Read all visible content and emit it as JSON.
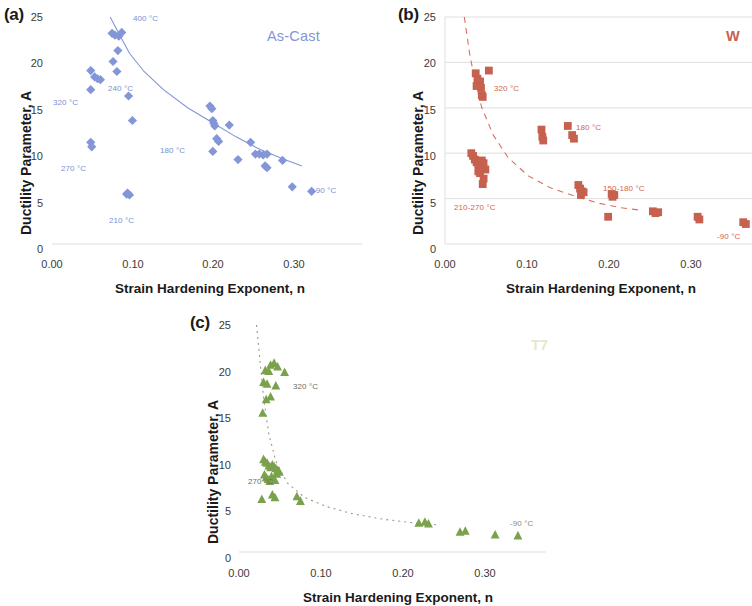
{
  "figure": {
    "axis_labels": {
      "x": "Strain Hardening Exponent, n",
      "y": "Ductility Parameter, A"
    },
    "xticks": [
      "0.00",
      "0.10",
      "0.20",
      "0.30"
    ],
    "xtick_values": [
      0.0,
      0.1,
      0.2,
      0.3
    ],
    "yticks": [
      "0",
      "5",
      "10",
      "15",
      "20",
      "25"
    ],
    "ytick_values": [
      0,
      5,
      10,
      15,
      20,
      25
    ]
  },
  "panels": [
    {
      "tag": "(a)",
      "title": "As-Cast",
      "color": "#8296d8",
      "marker": "diamond",
      "annotations": [
        {
          "text": "400 °C",
          "x": 0.105,
          "y": 24.2
        },
        {
          "text": "320 °C",
          "x": -0.004,
          "y": 15.3
        },
        {
          "text": "240 °C",
          "x": 0.073,
          "y": 17.3
        },
        {
          "text": "270 °C",
          "x": 0.012,
          "y": 8.6
        },
        {
          "text": "210 °C",
          "x": 0.058,
          "y": 3.1
        },
        {
          "text": "180 °C",
          "x": 0.137,
          "y": 10.3
        },
        {
          "text": "-90 °C",
          "x": 0.282,
          "y": 6.2
        }
      ]
    },
    {
      "tag": "(b)",
      "title": "W",
      "color": "#c5614e",
      "marker": "square",
      "annotations": [
        {
          "text": "320 °C",
          "x": 0.065,
          "y": 17.4
        },
        {
          "text": "180 °C",
          "x": 0.158,
          "y": 13.0
        },
        {
          "text": "150-180 °C",
          "x": 0.198,
          "y": 6.3
        },
        {
          "text": "210-270 °C",
          "x": 0.0,
          "y": 4.7
        },
        {
          "text": "-90 °C",
          "x": 0.318,
          "y": 1.3
        }
      ]
    },
    {
      "tag": "(c)",
      "title": "T7",
      "color": "#7aa14c",
      "marker": "triangle",
      "annotations": [
        {
          "text": "320 °C",
          "x": 0.055,
          "y": 18.3
        },
        {
          "text": "270 °C",
          "x": 0.0,
          "y": 8.5
        },
        {
          "text": "-90 °C",
          "x": 0.292,
          "y": 2.9
        }
      ]
    }
  ],
  "chart_data": [
    {
      "type": "scatter",
      "panel": "(a)",
      "title": "As-Cast",
      "xlabel": "Strain Hardening Exponent, n",
      "ylabel": "Ductility Parameter, A",
      "xlim": [
        0.0,
        0.32
      ],
      "ylim": [
        0,
        25
      ],
      "grid": false,
      "marker": "diamond",
      "color": "#8296d8",
      "trendline": {
        "style": "solid",
        "color": "#8296d8",
        "points": [
          [
            0.06,
            25.0
          ],
          [
            0.07,
            23.0
          ],
          [
            0.08,
            21.0
          ],
          [
            0.095,
            19.0
          ],
          [
            0.115,
            17.0
          ],
          [
            0.14,
            15.0
          ],
          [
            0.165,
            13.4
          ],
          [
            0.19,
            11.8
          ],
          [
            0.215,
            10.4
          ],
          [
            0.24,
            9.3
          ],
          [
            0.258,
            8.6
          ]
        ]
      },
      "points": [
        [
          0.062,
          23.2
        ],
        [
          0.065,
          23.0
        ],
        [
          0.069,
          22.9
        ],
        [
          0.072,
          23.3
        ],
        [
          0.068,
          21.3
        ],
        [
          0.063,
          20.1
        ],
        [
          0.067,
          19.0
        ],
        [
          0.04,
          19.1
        ],
        [
          0.044,
          18.4
        ],
        [
          0.047,
          18.2
        ],
        [
          0.05,
          18.1
        ],
        [
          0.04,
          17.0
        ],
        [
          0.079,
          16.3
        ],
        [
          0.083,
          13.6
        ],
        [
          0.04,
          11.2
        ],
        [
          0.041,
          10.7
        ],
        [
          0.077,
          5.5
        ],
        [
          0.08,
          5.4
        ],
        [
          0.078,
          5.6
        ],
        [
          0.163,
          15.2
        ],
        [
          0.165,
          14.9
        ],
        [
          0.166,
          13.6
        ],
        [
          0.167,
          13.3
        ],
        [
          0.168,
          13.0
        ],
        [
          0.183,
          13.1
        ],
        [
          0.17,
          11.6
        ],
        [
          0.172,
          11.3
        ],
        [
          0.166,
          10.2
        ],
        [
          0.205,
          11.2
        ],
        [
          0.192,
          9.3
        ],
        [
          0.21,
          9.9
        ],
        [
          0.214,
          9.9
        ],
        [
          0.218,
          9.8
        ],
        [
          0.222,
          9.9
        ],
        [
          0.22,
          8.6
        ],
        [
          0.222,
          8.4
        ],
        [
          0.238,
          9.2
        ],
        [
          0.248,
          6.3
        ],
        [
          0.268,
          5.8
        ]
      ]
    },
    {
      "type": "scatter",
      "panel": "(b)",
      "title": "W",
      "xlabel": "Strain Hardening Exponent, n",
      "ylabel": "Ductility Parameter, A",
      "xlim": [
        0.0,
        0.35
      ],
      "ylim": [
        0,
        25
      ],
      "grid": true,
      "marker": "square",
      "color": "#c5614e",
      "trendline": {
        "style": "dashed",
        "color": "#d9705c",
        "points": [
          [
            0.022,
            25.0
          ],
          [
            0.028,
            21.0
          ],
          [
            0.034,
            18.0
          ],
          [
            0.042,
            15.0
          ],
          [
            0.055,
            12.0
          ],
          [
            0.072,
            9.5
          ],
          [
            0.095,
            7.5
          ],
          [
            0.12,
            6.2
          ],
          [
            0.15,
            5.2
          ],
          [
            0.175,
            4.5
          ],
          [
            0.2,
            4.0
          ],
          [
            0.225,
            3.7
          ]
        ]
      },
      "points": [
        [
          0.035,
          18.8
        ],
        [
          0.037,
          18.2
        ],
        [
          0.038,
          17.8
        ],
        [
          0.036,
          17.4
        ],
        [
          0.04,
          17.9
        ],
        [
          0.041,
          17.2
        ],
        [
          0.042,
          16.4
        ],
        [
          0.043,
          16.2
        ],
        [
          0.05,
          19.1
        ],
        [
          0.03,
          10.0
        ],
        [
          0.032,
          9.7
        ],
        [
          0.034,
          9.3
        ],
        [
          0.036,
          9.0
        ],
        [
          0.038,
          8.8
        ],
        [
          0.04,
          8.5
        ],
        [
          0.042,
          9.2
        ],
        [
          0.044,
          8.9
        ],
        [
          0.046,
          8.2
        ],
        [
          0.044,
          7.2
        ],
        [
          0.043,
          6.6
        ],
        [
          0.04,
          7.8
        ],
        [
          0.038,
          8.0
        ],
        [
          0.11,
          12.6
        ],
        [
          0.111,
          11.8
        ],
        [
          0.112,
          11.4
        ],
        [
          0.14,
          13.0
        ],
        [
          0.145,
          12.0
        ],
        [
          0.147,
          11.6
        ],
        [
          0.152,
          6.5
        ],
        [
          0.154,
          6.1
        ],
        [
          0.156,
          5.8
        ],
        [
          0.155,
          5.4
        ],
        [
          0.158,
          5.7
        ],
        [
          0.19,
          5.5
        ],
        [
          0.193,
          5.4
        ],
        [
          0.191,
          5.2
        ],
        [
          0.186,
          3.0
        ],
        [
          0.237,
          3.6
        ],
        [
          0.24,
          3.4
        ],
        [
          0.243,
          3.5
        ],
        [
          0.288,
          3.0
        ],
        [
          0.29,
          2.7
        ],
        [
          0.34,
          2.4
        ],
        [
          0.343,
          2.2
        ]
      ]
    },
    {
      "type": "scatter",
      "panel": "(c)",
      "title": "T7",
      "xlabel": "Strain Hardening Exponent, n",
      "ylabel": "Ductility Parameter, A",
      "xlim": [
        0.0,
        0.35
      ],
      "ylim": [
        0,
        25
      ],
      "grid": false,
      "marker": "triangle",
      "color": "#7aa14c",
      "trendline": {
        "style": "dotted",
        "color": "#9a9a8a",
        "points": [
          [
            0.02,
            25.0
          ],
          [
            0.024,
            21.0
          ],
          [
            0.028,
            17.0
          ],
          [
            0.034,
            13.0
          ],
          [
            0.042,
            10.0
          ],
          [
            0.055,
            7.6
          ],
          [
            0.075,
            6.0
          ],
          [
            0.1,
            5.0
          ],
          [
            0.13,
            4.2
          ],
          [
            0.165,
            3.6
          ],
          [
            0.2,
            3.2
          ],
          [
            0.225,
            3.0
          ]
        ]
      },
      "points": [
        [
          0.036,
          20.6
        ],
        [
          0.04,
          20.8
        ],
        [
          0.044,
          20.4
        ],
        [
          0.03,
          20.0
        ],
        [
          0.034,
          19.9
        ],
        [
          0.052,
          19.8
        ],
        [
          0.028,
          18.7
        ],
        [
          0.032,
          18.5
        ],
        [
          0.042,
          18.3
        ],
        [
          0.036,
          17.1
        ],
        [
          0.031,
          16.8
        ],
        [
          0.027,
          15.3
        ],
        [
          0.028,
          10.2
        ],
        [
          0.03,
          9.9
        ],
        [
          0.032,
          9.8
        ],
        [
          0.034,
          9.5
        ],
        [
          0.036,
          9.3
        ],
        [
          0.038,
          9.6
        ],
        [
          0.04,
          9.4
        ],
        [
          0.042,
          9.2
        ],
        [
          0.044,
          9.0
        ],
        [
          0.046,
          8.8
        ],
        [
          0.029,
          8.5
        ],
        [
          0.031,
          8.2
        ],
        [
          0.033,
          8.0
        ],
        [
          0.035,
          7.8
        ],
        [
          0.037,
          8.3
        ],
        [
          0.039,
          8.1
        ],
        [
          0.041,
          7.9
        ],
        [
          0.043,
          8.6
        ],
        [
          0.045,
          8.9
        ],
        [
          0.026,
          5.8
        ],
        [
          0.038,
          6.3
        ],
        [
          0.041,
          6.0
        ],
        [
          0.066,
          6.1
        ],
        [
          0.07,
          5.6
        ],
        [
          0.205,
          3.2
        ],
        [
          0.212,
          3.3
        ],
        [
          0.216,
          3.1
        ],
        [
          0.252,
          2.2
        ],
        [
          0.258,
          2.3
        ],
        [
          0.292,
          1.9
        ],
        [
          0.318,
          1.8
        ]
      ]
    }
  ]
}
